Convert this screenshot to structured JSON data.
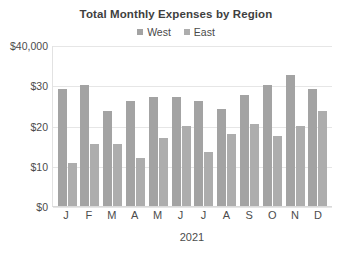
{
  "chart_data": {
    "type": "bar",
    "title": "Total Monthly Expenses by Region",
    "xlabel": "2021",
    "ylabel": "",
    "categories": [
      "J",
      "F",
      "M",
      "A",
      "M",
      "J",
      "J",
      "A",
      "S",
      "O",
      "N",
      "D"
    ],
    "series": [
      {
        "name": "West",
        "color": "#a3a3a3",
        "values": [
          29000,
          30000,
          23500,
          26000,
          27000,
          27000,
          26000,
          24000,
          27500,
          30000,
          32500,
          29000
        ]
      },
      {
        "name": "East",
        "color": "#adadad",
        "values": [
          10700,
          15500,
          15500,
          12000,
          16800,
          20000,
          13500,
          18000,
          20500,
          17500,
          20000,
          23500
        ]
      }
    ],
    "ylim": [
      0,
      40000
    ],
    "yticks": [
      {
        "value": 0,
        "label": "$0"
      },
      {
        "value": 10000,
        "label": "$10"
      },
      {
        "value": 20000,
        "label": "$20"
      },
      {
        "value": 30000,
        "label": "$30"
      },
      {
        "value": 40000,
        "label": "$40,000"
      }
    ],
    "grid": true,
    "legend_position": "top-center"
  }
}
